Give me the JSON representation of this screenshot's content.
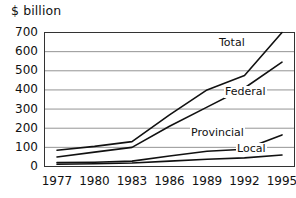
{
  "chart_data": {
    "type": "line",
    "title": "",
    "axis_note": "$ billion",
    "xlabel": "",
    "ylabel": "$ billion",
    "grid": true,
    "legend_position": "inline-right",
    "x": [
      1977,
      1980,
      1983,
      1986,
      1989,
      1992,
      1995
    ],
    "xlim": [
      1976,
      1996
    ],
    "ylim": [
      0,
      700
    ],
    "yticks": [
      0,
      100,
      200,
      300,
      400,
      500,
      600,
      700
    ],
    "xticks": [
      "1977",
      "1980",
      "1983",
      "1986",
      "1989",
      "1992",
      "1995"
    ],
    "series": [
      {
        "name": "Total",
        "label": "Total",
        "values": [
          85,
          105,
          130,
          270,
          400,
          475,
          700
        ]
      },
      {
        "name": "Federal",
        "label": "Federal",
        "values": [
          50,
          75,
          100,
          210,
          310,
          410,
          545
        ]
      },
      {
        "name": "Provincial",
        "label": "Provincial",
        "values": [
          20,
          22,
          28,
          55,
          80,
          90,
          165
        ]
      },
      {
        "name": "Local",
        "label": "Local",
        "values": [
          12,
          14,
          18,
          28,
          38,
          45,
          60
        ]
      }
    ]
  },
  "axis": {
    "y_label_text": "$ billion",
    "y_ticks": [
      "700",
      "600",
      "500",
      "400",
      "300",
      "200",
      "100",
      "0"
    ],
    "x_ticks": [
      "1977",
      "1980",
      "1983",
      "1986",
      "1989",
      "1992",
      "1995"
    ]
  },
  "labels": {
    "total": "Total",
    "federal": "Federal",
    "provincial": "Provincial",
    "local": "Local"
  },
  "colors": {
    "line": "#111111",
    "grid": "#888888",
    "frame": "#333333",
    "background": "#ffffff",
    "text": "#111111"
  }
}
